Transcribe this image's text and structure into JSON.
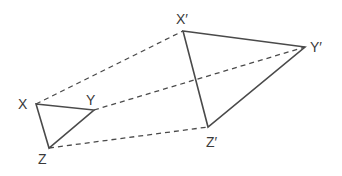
{
  "diagram": {
    "colors": {
      "line": "#4a4a4a",
      "text": "#3a3a3a",
      "background": "#ffffff"
    },
    "small_triangle": {
      "vertices": [
        {
          "name": "X",
          "label": "X",
          "x": 36,
          "y": 104,
          "label_x": 18,
          "label_y": 109
        },
        {
          "name": "Y",
          "label": "Y",
          "x": 94,
          "y": 110,
          "label_x": 86,
          "label_y": 105
        },
        {
          "name": "Z",
          "label": "Z",
          "x": 49,
          "y": 148,
          "label_x": 38,
          "label_y": 164
        }
      ]
    },
    "large_triangle": {
      "vertices": [
        {
          "name": "X'",
          "label": "X′",
          "x": 183,
          "y": 31,
          "label_x": 176,
          "label_y": 24
        },
        {
          "name": "Y'",
          "label": "Y′",
          "x": 305,
          "y": 47,
          "label_x": 310,
          "label_y": 52
        },
        {
          "name": "Z'",
          "label": "Z′",
          "x": 208,
          "y": 127,
          "label_x": 206,
          "label_y": 147
        }
      ]
    },
    "dashed_lines": [
      {
        "from": "X",
        "to": "X'"
      },
      {
        "from": "Y",
        "to": "Y'"
      },
      {
        "from": "Z",
        "to": "Z'"
      }
    ]
  }
}
